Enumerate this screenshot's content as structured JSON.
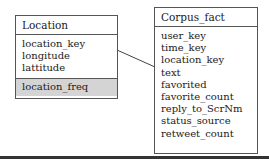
{
  "diagram": {
    "entities": [
      {
        "name": "Location",
        "attributes": [
          "location_key",
          "longitude",
          "lattitude"
        ],
        "derived_attributes": [
          "location_freq"
        ]
      },
      {
        "name": "Corpus_fact",
        "attributes": [
          "user_key",
          "time_key",
          "location_key",
          "text",
          "favorited",
          "favorite_count",
          "reply_to_ScrNm",
          "status_source",
          "retweet_count"
        ]
      }
    ],
    "relationships": [
      {
        "from": "Location.location_key",
        "to": "Corpus_fact.location_key"
      }
    ],
    "colors": {
      "border": "#555555",
      "shaded_section": "#d4d4d4",
      "background": "#ffffff"
    }
  }
}
